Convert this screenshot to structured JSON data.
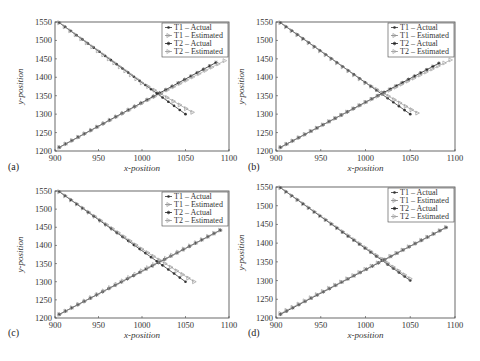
{
  "figure": {
    "panels": [
      "(a)",
      "(b)",
      "(c)",
      "(d)"
    ]
  },
  "chart_data": [
    {
      "panel": "(a)",
      "type": "line",
      "xlabel": "x-position",
      "ylabel": "y-position",
      "xlim": [
        900,
        1100
      ],
      "ylim": [
        1200,
        1550
      ],
      "xticks": [
        900,
        950,
        1000,
        1050,
        1100
      ],
      "yticks": [
        1200,
        1250,
        1300,
        1350,
        1400,
        1450,
        1500,
        1550
      ],
      "legend": [
        "T1 – Actual",
        "T1 – Estimated",
        "T2 – Actual",
        "T2 – Estimated"
      ],
      "legend_position": "upper right",
      "series": [
        {
          "name": "T1 – Actual",
          "marker": "dot",
          "points": [
            [
              905,
              1548
            ],
            [
              1050,
              1300
            ]
          ]
        },
        {
          "name": "T1 – Estimated",
          "marker": "triangle",
          "points": [
            [
              905,
              1548
            ],
            [
              1000,
              1385
            ],
            [
              1058,
              1305
            ]
          ]
        },
        {
          "name": "T2 – Actual",
          "marker": "star",
          "points": [
            [
              905,
              1210
            ],
            [
              1085,
              1440
            ]
          ]
        },
        {
          "name": "T2 – Estimated",
          "marker": "triangle",
          "points": [
            [
              905,
              1210
            ],
            [
              1000,
              1330
            ],
            [
              1095,
              1445
            ]
          ]
        }
      ]
    },
    {
      "panel": "(b)",
      "type": "line",
      "xlabel": "x-position",
      "ylabel": "y-position",
      "xlim": [
        900,
        1100
      ],
      "ylim": [
        1200,
        1550
      ],
      "xticks": [
        900,
        950,
        1000,
        1050,
        1100
      ],
      "yticks": [
        1200,
        1250,
        1300,
        1350,
        1400,
        1450,
        1500,
        1550
      ],
      "legend": [
        "T1 – Actual",
        "T1 – Estimated",
        "T2 – Actual",
        "T2 – Estimated"
      ],
      "legend_position": "upper right",
      "series": [
        {
          "name": "T1 – Actual",
          "marker": "dot",
          "points": [
            [
              905,
              1548
            ],
            [
              1050,
              1300
            ]
          ]
        },
        {
          "name": "T1 – Estimated",
          "marker": "triangle",
          "points": [
            [
              905,
              1548
            ],
            [
              1000,
              1385
            ],
            [
              1058,
              1303
            ]
          ]
        },
        {
          "name": "T2 – Actual",
          "marker": "star",
          "points": [
            [
              905,
              1210
            ],
            [
              1082,
              1438
            ]
          ]
        },
        {
          "name": "T2 – Estimated",
          "marker": "triangle",
          "points": [
            [
              905,
              1210
            ],
            [
              1000,
              1332
            ],
            [
              1095,
              1447
            ]
          ]
        }
      ]
    },
    {
      "panel": "(c)",
      "type": "line",
      "xlabel": "x-position",
      "ylabel": "y-position",
      "xlim": [
        900,
        1100
      ],
      "ylim": [
        1200,
        1550
      ],
      "xticks": [
        900,
        950,
        1000,
        1050,
        1100
      ],
      "yticks": [
        1200,
        1250,
        1300,
        1350,
        1400,
        1450,
        1500,
        1550
      ],
      "legend": [
        "T1 – Actual",
        "T1 – Estimated",
        "T2 – Actual",
        "T2 – Estimated"
      ],
      "legend_position": "upper right",
      "series": [
        {
          "name": "T1 – Actual",
          "marker": "dot",
          "points": [
            [
              905,
              1548
            ],
            [
              1050,
              1300
            ]
          ]
        },
        {
          "name": "T1 – Estimated",
          "marker": "triangle",
          "points": [
            [
              905,
              1548
            ],
            [
              1000,
              1390
            ],
            [
              1060,
              1300
            ]
          ]
        },
        {
          "name": "T2 – Actual",
          "marker": "star",
          "points": [
            [
              905,
              1210
            ],
            [
              1090,
              1442
            ]
          ]
        },
        {
          "name": "T2 – Estimated",
          "marker": "triangle",
          "points": [
            [
              905,
              1210
            ],
            [
              1000,
              1330
            ],
            [
              1090,
              1442
            ]
          ]
        }
      ]
    },
    {
      "panel": "(d)",
      "type": "line",
      "xlabel": "x-position",
      "ylabel": "y-position",
      "xlim": [
        900,
        1100
      ],
      "ylim": [
        1200,
        1550
      ],
      "xticks": [
        900,
        950,
        1000,
        1050,
        1100
      ],
      "yticks": [
        1200,
        1250,
        1300,
        1350,
        1400,
        1450,
        1500,
        1550
      ],
      "legend": [
        "T1 – Actual",
        "T1 – Estimated",
        "T2 – Actual",
        "T2 – Estimated"
      ],
      "legend_position": "upper right",
      "series": [
        {
          "name": "T1 – Actual",
          "marker": "dot",
          "points": [
            [
              905,
              1548
            ],
            [
              1050,
              1300
            ]
          ]
        },
        {
          "name": "T1 – Estimated",
          "marker": "triangle",
          "points": [
            [
              905,
              1548
            ],
            [
              1000,
              1388
            ],
            [
              1050,
              1305
            ]
          ]
        },
        {
          "name": "T2 – Actual",
          "marker": "star",
          "points": [
            [
              905,
              1210
            ],
            [
              1090,
              1442
            ]
          ]
        },
        {
          "name": "T2 – Estimated",
          "marker": "triangle",
          "points": [
            [
              905,
              1212
            ],
            [
              1000,
              1330
            ],
            [
              1090,
              1442
            ]
          ]
        }
      ]
    }
  ]
}
